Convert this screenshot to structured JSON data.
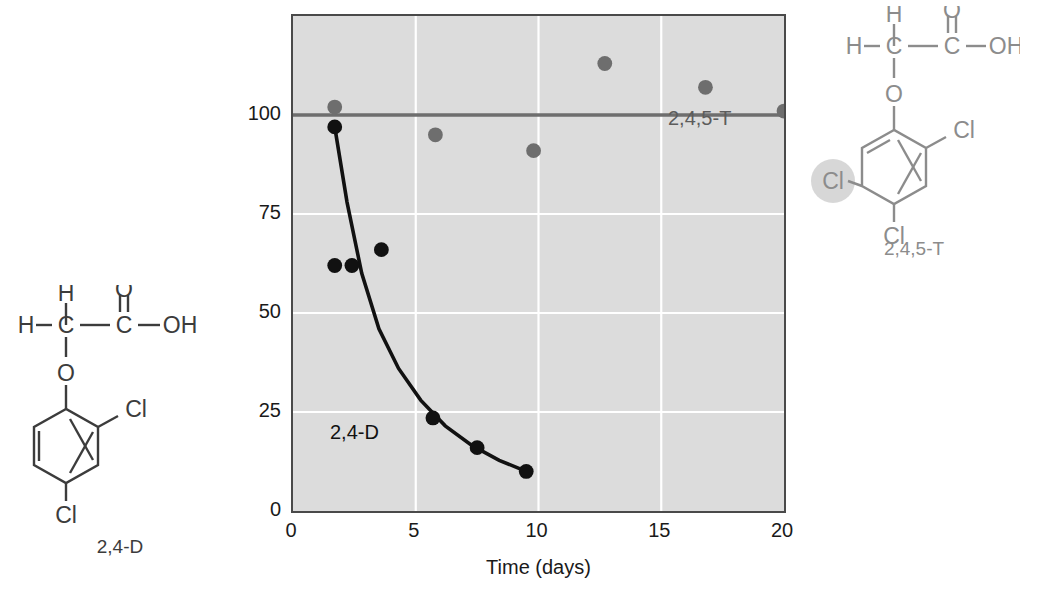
{
  "figure": {
    "background": "#ffffff",
    "plot_background": "#dcdcdc",
    "gridline_color": "#ffffff",
    "axis_color": "#4a4a4a"
  },
  "chart_data": {
    "type": "scatter",
    "title": "",
    "xlabel": "Time (days)",
    "ylabel": "Relative herbicide concentration",
    "xlim": [
      0,
      20
    ],
    "ylim": [
      0,
      125
    ],
    "xticks": [
      "0",
      "5",
      "10",
      "15",
      "20"
    ],
    "xtick_values": [
      0,
      5,
      10,
      15,
      20
    ],
    "yticks": [
      "0",
      "25",
      "50",
      "75",
      "100"
    ],
    "ytick_values": [
      0,
      25,
      50,
      75,
      100
    ],
    "grid": true,
    "legend_position": "inline-annotations",
    "series": [
      {
        "name": "2,4-D",
        "color": "#111111",
        "marker": "filled-circle",
        "label_x": 2.4,
        "label_y": 19,
        "points": [
          {
            "x": 1.7,
            "y": 97
          },
          {
            "x": 1.7,
            "y": 62
          },
          {
            "x": 2.4,
            "y": 62
          },
          {
            "x": 3.6,
            "y": 66
          },
          {
            "x": 5.7,
            "y": 23.5
          },
          {
            "x": 7.5,
            "y": 16
          },
          {
            "x": 9.5,
            "y": 10
          }
        ],
        "fit_curve": {
          "description": "exponential decay fit drawn through 2,4-D points",
          "x": [
            1.7,
            2.2,
            2.8,
            3.5,
            4.3,
            5.2,
            6.2,
            7.3,
            8.4,
            9.5
          ],
          "y": [
            97,
            78,
            60,
            46,
            36,
            28,
            21.5,
            16.5,
            12.8,
            10
          ]
        }
      },
      {
        "name": "2,4,5-T",
        "color": "#6e6e6e",
        "marker": "filled-circle",
        "label_x": 15.3,
        "label_y": 88,
        "points": [
          {
            "x": 1.7,
            "y": 102
          },
          {
            "x": 5.8,
            "y": 95
          },
          {
            "x": 9.8,
            "y": 91
          },
          {
            "x": 12.7,
            "y": 113
          },
          {
            "x": 16.8,
            "y": 107
          },
          {
            "x": 20.0,
            "y": 101
          }
        ],
        "reference_line": {
          "description": "flat gray line at 100 spanning full x-range",
          "y": 100,
          "x_start": 0,
          "x_end": 20,
          "color": "#6e6e6e"
        }
      }
    ]
  },
  "structures": [
    {
      "id": "24d",
      "caption": "2,4-D",
      "color": "#3c3c3c",
      "atoms": {
        "h_top": "H",
        "h_left": "H",
        "c_alpha": "C",
        "c_carboxyl": "C",
        "o_double": "O",
        "oh": "OH",
        "o_ether": "O",
        "cl_2": "Cl",
        "cl_4": "Cl"
      },
      "highlight": null
    },
    {
      "id": "245t",
      "caption": "2,4,5-T",
      "color": "#8c8c8c",
      "atoms": {
        "h_top": "H",
        "h_left": "H",
        "c_alpha": "C",
        "c_carboxyl": "C",
        "o_double": "O",
        "oh": "OH",
        "o_ether": "O",
        "cl_2": "Cl",
        "cl_4": "Cl",
        "cl_5": "Cl"
      },
      "highlight": {
        "atom": "cl_5",
        "color": "#d0d0d0"
      }
    }
  ]
}
